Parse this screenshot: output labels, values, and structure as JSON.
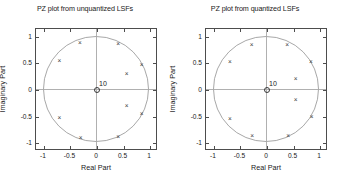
{
  "figure": {
    "background": "#ffffff",
    "axis_color": "#4d4d4d",
    "grid_color": "#b0b0b0",
    "circle_color": "#a8a8a8",
    "marker_color": "#3a3a3a"
  },
  "panels": [
    {
      "title": "PZ plot from unquantized LSFs",
      "xlabel": "Real Part",
      "ylabel": "Imaginary Part",
      "zero_label": "10",
      "marker_glyph": "×",
      "xticks": [
        "-1",
        "-0.5",
        "0",
        "0.5",
        "1"
      ],
      "yticks": [
        "1",
        "0.5",
        "0",
        "-0.5",
        "-1"
      ]
    },
    {
      "title": "PZ plot from quantized LSFs",
      "xlabel": "Real Part",
      "ylabel": "Imaginary Part",
      "zero_label": "10",
      "marker_glyph": "×",
      "xticks": [
        "-1",
        "-0.5",
        "0",
        "0.5",
        "1"
      ],
      "yticks": [
        "1",
        "0.5",
        "0",
        "-0.5",
        "-1"
      ]
    }
  ],
  "chart_data": [
    {
      "type": "scatter",
      "title": "PZ plot from unquantized LSFs",
      "xlabel": "Real Part",
      "ylabel": "Imaginary Part",
      "xlim": [
        -1.15,
        1.15
      ],
      "ylim": [
        -1.15,
        1.15
      ],
      "xticks": [
        -1,
        -0.5,
        0,
        0.5,
        1
      ],
      "yticks": [
        -1,
        -0.5,
        0,
        0.5,
        1
      ],
      "grid": false,
      "legend": "none",
      "annotations": [
        {
          "text": "10",
          "x": 0.0,
          "y": 0.0,
          "note": "multiplicity of zeros at origin"
        }
      ],
      "reference_shapes": [
        {
          "type": "circle",
          "cx": 0,
          "cy": 0,
          "r": 1.0,
          "name": "unit-circle"
        }
      ],
      "series": [
        {
          "name": "poles",
          "marker": "x",
          "points": [
            {
              "x": -0.32,
              "y": 0.89
            },
            {
              "x": 0.4,
              "y": 0.87
            },
            {
              "x": -0.71,
              "y": 0.54
            },
            {
              "x": 0.84,
              "y": 0.47
            },
            {
              "x": 0.56,
              "y": 0.31
            },
            {
              "x": 0.56,
              "y": -0.3
            },
            {
              "x": 0.84,
              "y": -0.46
            },
            {
              "x": -0.71,
              "y": -0.53
            },
            {
              "x": -0.31,
              "y": -0.9
            },
            {
              "x": 0.4,
              "y": -0.88
            }
          ]
        },
        {
          "name": "zeros",
          "marker": "o",
          "points": [
            {
              "x": 0.0,
              "y": 0.0,
              "multiplicity": 10
            }
          ]
        }
      ]
    },
    {
      "type": "scatter",
      "title": "PZ plot from quantized LSFs",
      "xlabel": "Real Part",
      "ylabel": "Imaginary Part",
      "xlim": [
        -1.15,
        1.15
      ],
      "ylim": [
        -1.15,
        1.15
      ],
      "xticks": [
        -1,
        -0.5,
        0,
        0.5,
        1
      ],
      "yticks": [
        -1,
        -0.5,
        0,
        0.5,
        1
      ],
      "grid": false,
      "legend": "none",
      "annotations": [
        {
          "text": "10",
          "x": 0.0,
          "y": 0.0,
          "note": "multiplicity of zeros at origin"
        }
      ],
      "reference_shapes": [
        {
          "type": "circle",
          "cx": 0,
          "cy": 0,
          "r": 1.0,
          "name": "unit-circle"
        }
      ],
      "series": [
        {
          "name": "poles",
          "marker": "x",
          "points": [
            {
              "x": -0.29,
              "y": 0.84
            },
            {
              "x": 0.38,
              "y": 0.85
            },
            {
              "x": -0.7,
              "y": 0.52
            },
            {
              "x": 0.83,
              "y": 0.52
            },
            {
              "x": 0.54,
              "y": 0.2
            },
            {
              "x": 0.54,
              "y": -0.19
            },
            {
              "x": 0.84,
              "y": -0.51
            },
            {
              "x": -0.7,
              "y": -0.54
            },
            {
              "x": -0.28,
              "y": -0.87
            },
            {
              "x": 0.4,
              "y": -0.87
            }
          ]
        },
        {
          "name": "zeros",
          "marker": "o",
          "points": [
            {
              "x": 0.0,
              "y": 0.0,
              "multiplicity": 10
            }
          ]
        }
      ]
    }
  ]
}
